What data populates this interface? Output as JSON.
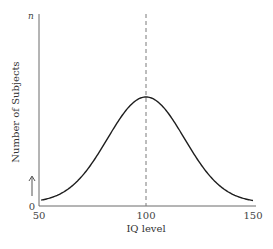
{
  "chart_data": {
    "type": "line",
    "title": "",
    "xlabel": "IQ level",
    "ylabel": "Number of Subjects",
    "y_top_label": "n",
    "y_bottom_label": "0",
    "xlim": [
      50,
      152
    ],
    "ylim": [
      0,
      1.2
    ],
    "x_ticks": [
      {
        "value": 50,
        "label": "50"
      },
      {
        "value": 100,
        "label": "100"
      },
      {
        "value": 150,
        "label": "150"
      }
    ],
    "grid": false,
    "legend": "none",
    "series": [
      {
        "name": "Normal distribution of IQ",
        "distribution": "normal",
        "mean": 100,
        "sd": 18,
        "peak": 1.0,
        "baseline": 0.0,
        "x_range": [
          51,
          150
        ]
      }
    ],
    "annotations": [
      {
        "type": "vertical-dashed-line",
        "x": 100,
        "text": ""
      },
      {
        "type": "upward-arrow",
        "near": "y-axis-bottom",
        "text": ""
      }
    ]
  }
}
